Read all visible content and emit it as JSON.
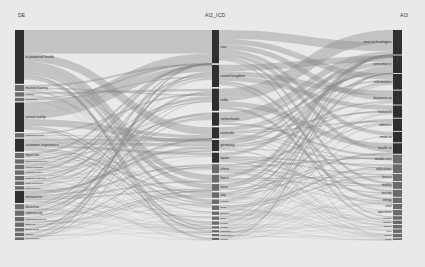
{
  "figure": {
    "type": "sankey",
    "background": "#e9e9e9",
    "node_color_dark": "#2f2f2f",
    "node_color_mid": "#6b6b6b",
    "link_color": "#8a8a8a",
    "width": 425,
    "height": 267
  },
  "headers": [
    {
      "key": "left",
      "label": "DE",
      "x": 18,
      "align": "left"
    },
    {
      "key": "middle",
      "label": "AI2_ICD",
      "x": 205,
      "align": "left"
    },
    {
      "key": "right",
      "label": "AI3",
      "x": 400,
      "align": "left"
    }
  ],
  "chart_data": {
    "type": "sankey",
    "title": "",
    "columns": [
      "DE",
      "AI2_ICD",
      "AI3"
    ],
    "stages": [
      {
        "name": "DE",
        "nodes": [
          {
            "label": "ai-powered health",
            "value": 62
          },
          {
            "label": "machine learning",
            "value": 7
          },
          {
            "label": "robotics",
            "value": 5
          },
          {
            "label": "automation",
            "value": 4
          },
          {
            "label": "virtual reality",
            "value": 34
          },
          {
            "label": "augmented reality",
            "value": 5
          },
          {
            "label": "customer experience",
            "value": 15
          },
          {
            "label": "digital twin",
            "value": 6
          },
          {
            "label": "smart manufacturing",
            "value": 5
          },
          {
            "label": "natural language",
            "value": 5
          },
          {
            "label": "computer vision",
            "value": 5
          },
          {
            "label": "predictive analytics",
            "value": 5
          },
          {
            "label": "edge computing",
            "value": 4
          },
          {
            "label": "cloud platform",
            "value": 4
          },
          {
            "label": "metaverse",
            "value": 14
          },
          {
            "label": "blockchain",
            "value": 6
          },
          {
            "label": "cybersecurity",
            "value": 6
          },
          {
            "label": "autonomous driving",
            "value": 5
          },
          {
            "label": "smart city",
            "value": 5
          },
          {
            "label": "digital health",
            "value": 4
          },
          {
            "label": "fintech",
            "value": 4
          },
          {
            "label": "green energy",
            "value": 3
          }
        ]
      },
      {
        "name": "AI2_ICD",
        "nodes": [
          {
            "label": "usa",
            "value": 30
          },
          {
            "label": "united kingdom",
            "value": 20
          },
          {
            "label": "india",
            "value": 20
          },
          {
            "label": "netherlands",
            "value": 12
          },
          {
            "label": "australia",
            "value": 10
          },
          {
            "label": "germany",
            "value": 10
          },
          {
            "label": "spain",
            "value": 9
          },
          {
            "label": "china",
            "value": 8
          },
          {
            "label": "france",
            "value": 7
          },
          {
            "label": "korea",
            "value": 6
          },
          {
            "label": "italy",
            "value": 5
          },
          {
            "label": "canada",
            "value": 4
          },
          {
            "label": "japan",
            "value": 4
          },
          {
            "label": "sweden",
            "value": 3
          },
          {
            "label": "brazil",
            "value": 3
          },
          {
            "label": "ireland",
            "value": 3
          },
          {
            "label": "norway",
            "value": 2
          },
          {
            "label": "singapore",
            "value": 2
          },
          {
            "label": "switzerland",
            "value": 2
          },
          {
            "label": "poland",
            "value": 2
          }
        ]
      },
      {
        "name": "AI3",
        "nodes": [
          {
            "label": "new technologies",
            "value": 14
          },
          {
            "label": "consumer e",
            "value": 10
          },
          {
            "label": "information",
            "value": 9
          },
          {
            "label": "business ai",
            "value": 8
          },
          {
            "label": "research",
            "value": 7
          },
          {
            "label": "robotics",
            "value": 7
          },
          {
            "label": "main ai",
            "value": 6
          },
          {
            "label": "health ai",
            "value": 6
          },
          {
            "label": "media arts",
            "value": 5
          },
          {
            "label": "education",
            "value": 5
          },
          {
            "label": "finance",
            "value": 4
          },
          {
            "label": "mobility",
            "value": 4
          },
          {
            "label": "security",
            "value": 4
          },
          {
            "label": "energy",
            "value": 3
          },
          {
            "label": "retail",
            "value": 3
          },
          {
            "label": "agriculture",
            "value": 3
          },
          {
            "label": "logistics",
            "value": 2
          },
          {
            "label": "industry",
            "value": 2
          },
          {
            "label": "gaming",
            "value": 2
          },
          {
            "label": "legal",
            "value": 2
          },
          {
            "label": "climate",
            "value": 2
          },
          {
            "label": "space",
            "value": 1
          }
        ]
      }
    ]
  }
}
